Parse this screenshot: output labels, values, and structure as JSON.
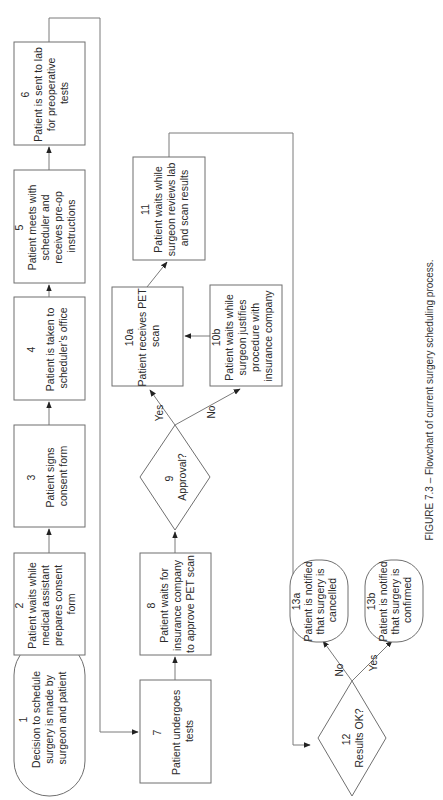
{
  "figure": {
    "caption": "FIGURE 7.3 – Flowchart of current surgery scheduling process.",
    "orientation": "rotated-90-ccw",
    "colors": {
      "stroke": "#6f6f6f",
      "text": "#2a2a2a",
      "background": "#ffffff"
    }
  },
  "nodes": [
    {
      "id": "1",
      "shape": "terminator",
      "number": "1",
      "lines": [
        "Decision to schedule",
        "surgery is made by",
        "surgeon and patient"
      ]
    },
    {
      "id": "2",
      "shape": "process",
      "number": "2",
      "lines": [
        "Patient waits while",
        "medical assistant",
        "prepares consent",
        "form"
      ]
    },
    {
      "id": "3",
      "shape": "process",
      "number": "3",
      "lines": [
        "Patient signs",
        "consent form"
      ]
    },
    {
      "id": "4",
      "shape": "process",
      "number": "4",
      "lines": [
        "Patient is taken to",
        "scheduler’s office"
      ]
    },
    {
      "id": "5",
      "shape": "process",
      "number": "5",
      "lines": [
        "Patient meets with",
        "scheduler and",
        "receives pre-op",
        "instructions"
      ]
    },
    {
      "id": "6",
      "shape": "process",
      "number": "6",
      "lines": [
        "Patient is sent to lab",
        "for preoperative",
        "tests"
      ]
    },
    {
      "id": "7",
      "shape": "process",
      "number": "7",
      "lines": [
        "Patient undergoes",
        "tests"
      ]
    },
    {
      "id": "8",
      "shape": "process",
      "number": "8",
      "lines": [
        "Patient waits for",
        "insurance company",
        "to approve PET scan"
      ]
    },
    {
      "id": "9",
      "shape": "decision",
      "number": "9",
      "lines": [
        "Approval?"
      ]
    },
    {
      "id": "10a",
      "shape": "process",
      "number": "10a",
      "lines": [
        "Patient receives PET",
        "scan"
      ]
    },
    {
      "id": "10b",
      "shape": "process",
      "number": "10b",
      "lines": [
        "Patient waits while",
        "surgeon justifies",
        "procedure with",
        "insurance company"
      ]
    },
    {
      "id": "11",
      "shape": "process",
      "number": "11",
      "lines": [
        "Patient waits while",
        "surgeon reviews lab",
        "and scan results"
      ]
    },
    {
      "id": "12",
      "shape": "decision",
      "number": "12",
      "lines": [
        "Results OK?"
      ]
    },
    {
      "id": "13a",
      "shape": "terminator",
      "number": "13a",
      "lines": [
        "Patient is notified",
        "that surgery is",
        "cancelled"
      ]
    },
    {
      "id": "13b",
      "shape": "terminator",
      "number": "13b",
      "lines": [
        "Patient is notified",
        "that surgery is",
        "confirmed"
      ]
    }
  ],
  "edges": [
    {
      "from": "1",
      "to": "2",
      "label": ""
    },
    {
      "from": "2",
      "to": "3",
      "label": ""
    },
    {
      "from": "3",
      "to": "4",
      "label": ""
    },
    {
      "from": "4",
      "to": "5",
      "label": ""
    },
    {
      "from": "5",
      "to": "6",
      "label": ""
    },
    {
      "from": "6",
      "to": "7",
      "label": ""
    },
    {
      "from": "7",
      "to": "8",
      "label": ""
    },
    {
      "from": "8",
      "to": "9",
      "label": ""
    },
    {
      "from": "9",
      "to": "10a",
      "label": "Yes"
    },
    {
      "from": "9",
      "to": "10b",
      "label": "No"
    },
    {
      "from": "10b",
      "to": "10a",
      "label": ""
    },
    {
      "from": "10a",
      "to": "11",
      "label": ""
    },
    {
      "from": "11",
      "to": "12",
      "label": ""
    },
    {
      "from": "12",
      "to": "13a",
      "label": "No"
    },
    {
      "from": "12",
      "to": "13b",
      "label": "Yes"
    }
  ],
  "edge_labels": {
    "approval_yes": "Yes",
    "approval_no": "No",
    "results_no": "No",
    "results_yes": "Yes"
  }
}
